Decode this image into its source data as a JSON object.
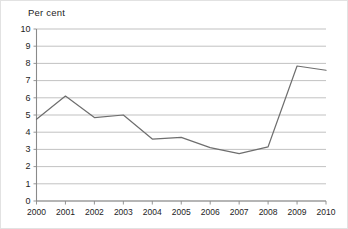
{
  "chart_data": {
    "type": "line",
    "title": "Per cent",
    "xlabel": "",
    "ylabel": "",
    "categories": [
      "2000",
      "2001",
      "2002",
      "2003",
      "2004",
      "2005",
      "2006",
      "2007",
      "2008",
      "2009",
      "2010"
    ],
    "x": [
      2000,
      2001,
      2002,
      2003,
      2004,
      2005,
      2006,
      2007,
      2008,
      2009,
      2010
    ],
    "values": [
      4.75,
      6.1,
      4.85,
      5.0,
      3.6,
      3.7,
      3.1,
      2.75,
      3.15,
      7.85,
      7.6
    ],
    "series": [
      {
        "name": "Per cent",
        "values": [
          4.75,
          6.1,
          4.85,
          5.0,
          3.6,
          3.7,
          3.1,
          2.75,
          3.15,
          7.85,
          7.6
        ]
      }
    ],
    "ylim": [
      0,
      10
    ],
    "ytick_labels": [
      "0",
      "1",
      "2",
      "3",
      "4",
      "5",
      "6",
      "7",
      "8",
      "9",
      "10"
    ],
    "ytick_values": [
      0,
      1,
      2,
      3,
      4,
      5,
      6,
      7,
      8,
      9,
      10
    ],
    "xtick_labels": [
      "2000",
      "2001",
      "2002",
      "2003",
      "2004",
      "2005",
      "2006",
      "2007",
      "2008",
      "2009",
      "2010"
    ],
    "grid": true,
    "grid_axis": "y",
    "legend": false,
    "legend_position": "none",
    "line_color": "#6e6e6e",
    "grid_color": "#a8a8a8",
    "axis_color": "#8a8a8a",
    "text_color": "#1d1d1d",
    "background_color": "#ffffff"
  }
}
